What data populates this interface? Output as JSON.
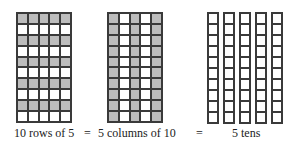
{
  "diagram": {
    "grid_rows": {
      "rows": 10,
      "cols": 5,
      "shaded_rows": [
        0,
        2,
        4,
        6,
        8
      ],
      "label": "10 rows of 5"
    },
    "grid_columns": {
      "rows": 10,
      "cols": 5,
      "shaded_cols": [
        0,
        2,
        4
      ],
      "label": "5 columns of 10"
    },
    "tens_rods": {
      "rods": 5,
      "cells_per_rod": 10,
      "label": "5 tens"
    },
    "equals_1": "=",
    "equals_2": "=",
    "colors": {
      "shaded": "#bdbdbd",
      "line": "#3a3a3a",
      "background": "#ffffff"
    }
  }
}
